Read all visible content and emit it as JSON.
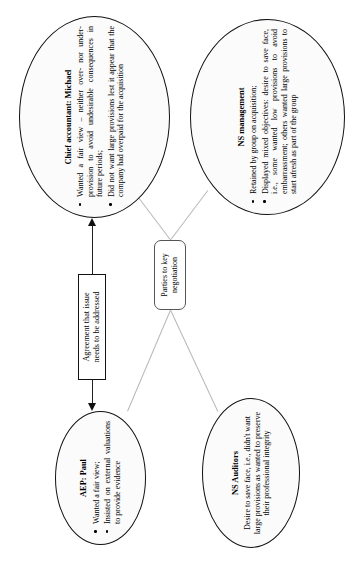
{
  "diagram": {
    "title": "Parties to key negotiation",
    "orientation": "rotated-90-ccw",
    "colors": {
      "node_fill": "#fbfbfb",
      "node_border": "#111111",
      "connector_thin": "#b7b7b7",
      "connector_thick": "#222222",
      "text": "#000000"
    }
  },
  "center": {
    "label": "Parties to key\nnegotiation",
    "line1": "Parties to key",
    "line2": "negotiation"
  },
  "agreement": {
    "label": "Agreement that issue\nneeds to be addressed",
    "line1": "Agreement that issue",
    "line2": "needs to be addressed"
  },
  "nodes": {
    "aep": {
      "title": "AEP: Paul",
      "bullets": [
        "Wanted a fair view;",
        "Insisted on external valuations to provide evidence"
      ]
    },
    "auditors": {
      "title": "NS Auditors",
      "text": "Desire to save face, i.e., didn't want large provisions as wanted to preserve their professional integrity"
    },
    "chief_accountant": {
      "title": "Chief accountant: Michael",
      "bullets": [
        "Wanted a fair view – neither over- nor under-provision to avoid undesirable consequences in future periods;",
        "Did not want large provisions lest it appear that the company had overpaid for the acquisition"
      ]
    },
    "ns_management": {
      "title": "NS management",
      "bullets": [
        "Retained by group on acquisition;",
        "Displayed mixed objectives: desire to save face, i.e., some wanted low provisions to avoid embarrassment; others wanted large provisions to start afresh as part of the group"
      ]
    }
  }
}
